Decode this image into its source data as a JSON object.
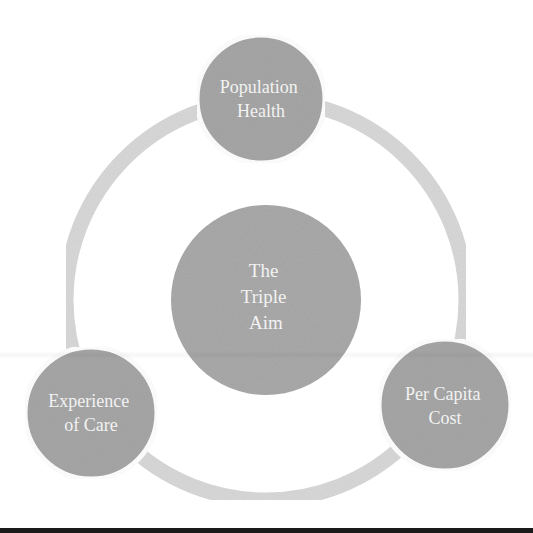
{
  "diagram": {
    "title": "The Triple Aim",
    "center": {
      "lines": [
        "The",
        "Triple",
        "Aim"
      ],
      "cx": 266,
      "cy": 300,
      "r": 95
    },
    "nodes": [
      {
        "id": "population-health",
        "lines": [
          "Population",
          "Health"
        ],
        "cx": 261,
        "cy": 99,
        "r": 64
      },
      {
        "id": "experience-of-care",
        "lines": [
          "Experience",
          "of Care"
        ],
        "cx": 91,
        "cy": 413,
        "r": 66
      },
      {
        "id": "per-capita-cost",
        "lines": [
          "Per Capita",
          "Cost"
        ],
        "cx": 445,
        "cy": 405,
        "r": 66
      }
    ],
    "ring": {
      "cx": 266,
      "cy": 300,
      "r": 200,
      "width": 15
    },
    "colors": {
      "circle_fill": "#a6a6a6",
      "center_fill": "#a9a9a9",
      "ring": "#d8d8d8",
      "text": "#f2f2f2",
      "background": "#ffffff",
      "bottom_bar": "#1a1a1a"
    }
  }
}
